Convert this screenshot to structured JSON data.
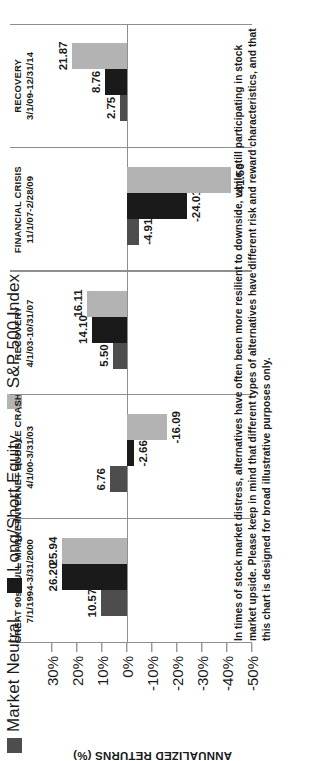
{
  "legend": {
    "items": [
      {
        "label": "Market Neutral",
        "color": "#4d4d4d"
      },
      {
        "label": "Long/Short Equity",
        "color": "#1a1a1a"
      },
      {
        "label": "S&P 500 Index",
        "color": "#b3b3b3"
      }
    ]
  },
  "axis": {
    "title": "ANNUALIZED RETURNS (%)",
    "ticks": [
      "30%",
      "20%",
      "10%",
      "0%",
      "-10%",
      "-20%",
      "-30%",
      "-40%",
      "-50%"
    ]
  },
  "footnote": "In times of stock market distress, alternatives have often been more resilient to downside, while still participating in stock market upside. Please keep in mind that different types of alternatives have different risk and reward characteristics, and that this chart is designed for broad illustrative purposes only.",
  "chart_data": {
    "type": "bar",
    "title": "",
    "xlabel": "",
    "ylabel": "ANNUALIZED RETURNS (%)",
    "ylim": [
      -50,
      30
    ],
    "grid": false,
    "legend_position": "top-left",
    "categories": [
      {
        "name": "GREAT 90s BULL MARKET",
        "period": "7/1/1994-3/31/2000"
      },
      {
        "name": "INTERNET BUBBLE CRASH",
        "period": "4/1/00-3/31/03"
      },
      {
        "name": "RECOVERY",
        "period": "4/1/03-10/31/07"
      },
      {
        "name": "FINANCIAL CRISIS",
        "period": "11/1/07-2/28/09"
      },
      {
        "name": "RECOVERY",
        "period": "3/1/09-12/31/14"
      }
    ],
    "series": [
      {
        "name": "Market Neutral",
        "color": "#4d4d4d",
        "values": [
          10.57,
          6.76,
          5.5,
          -4.91,
          2.75
        ]
      },
      {
        "name": "Long/Short Equity",
        "color": "#1a1a1a",
        "values": [
          26.2,
          -2.66,
          14.1,
          -24.01,
          8.76
        ]
      },
      {
        "name": "S&P 500 Index",
        "color": "#b3b3b3",
        "values": [
          25.94,
          -16.09,
          16.11,
          -41.5,
          21.87
        ]
      }
    ],
    "value_labels": [
      [
        "10.57",
        "26.20",
        "25.94"
      ],
      [
        "6.76",
        "-2.66",
        "-16.09"
      ],
      [
        "5.50",
        "14.10",
        "16.11"
      ],
      [
        "-4.91",
        "-24.01",
        "-41.50"
      ],
      [
        "2.75",
        "8.76",
        "21.87"
      ]
    ]
  }
}
